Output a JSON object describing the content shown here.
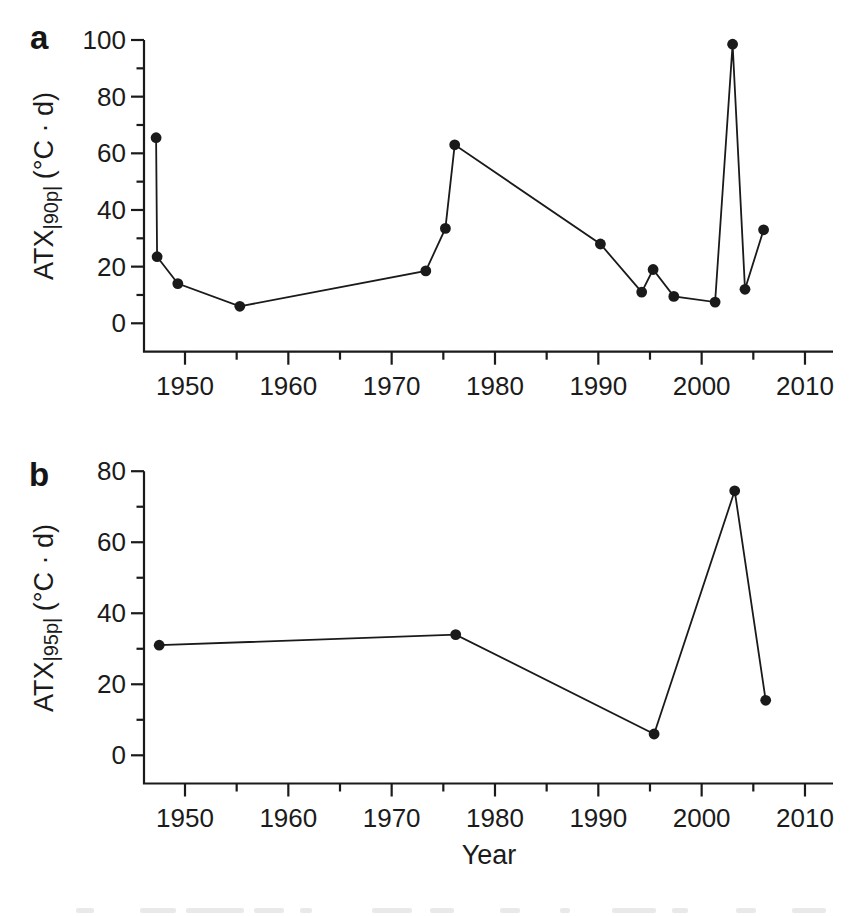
{
  "figure": {
    "panels": [
      {
        "id": "a",
        "label": "a",
        "y_title": {
          "base": "ATX",
          "sub": "|90p|",
          "unit": "(°C · d)"
        }
      },
      {
        "id": "b",
        "label": "b",
        "y_title": {
          "base": "ATX",
          "sub": "|95p|",
          "unit": "(°C · d)"
        }
      }
    ],
    "x_title": "Year"
  },
  "chart_data": [
    {
      "type": "line",
      "panel": "a",
      "title": "",
      "xlabel": "",
      "ylabel": "ATX|90p| (°C·d)",
      "x": [
        1947.2,
        1947.3,
        1949.3,
        1955.3,
        1973.3,
        1975.2,
        1976.1,
        1990.2,
        1994.2,
        1995.3,
        1997.3,
        2001.3,
        2003.0,
        2004.2,
        2006.0
      ],
      "y": [
        65.5,
        23.5,
        14,
        6,
        18.5,
        33.5,
        63,
        28,
        11,
        19,
        9.5,
        7.5,
        98.5,
        12,
        33
      ],
      "xlim": [
        1946,
        2012.7
      ],
      "ylim": [
        0,
        100
      ],
      "x_ticks": [
        1950,
        1960,
        1970,
        1980,
        1990,
        2000,
        2010
      ],
      "x_minor_ticks": [
        1955,
        1965,
        1975,
        1985,
        1995,
        2005
      ],
      "y_ticks": [
        0,
        20,
        40,
        60,
        80,
        100
      ],
      "y_minor_ticks": [
        10,
        30,
        50,
        70,
        90
      ],
      "legend": "none",
      "grid": false,
      "marker": "filled-circle",
      "line_color": "#1a1a1a"
    },
    {
      "type": "line",
      "panel": "b",
      "title": "",
      "xlabel": "Year",
      "ylabel": "ATX|95p| (°C·d)",
      "x": [
        1947.5,
        1976.2,
        1995.4,
        2003.2,
        2006.2
      ],
      "y": [
        31,
        34,
        6,
        74.5,
        15.5
      ],
      "xlim": [
        1946,
        2012.7
      ],
      "ylim": [
        0,
        80
      ],
      "x_ticks": [
        1950,
        1960,
        1970,
        1980,
        1990,
        2000,
        2010
      ],
      "x_minor_ticks": [
        1955,
        1965,
        1975,
        1985,
        1995,
        2005
      ],
      "y_ticks": [
        0,
        20,
        40,
        60,
        80
      ],
      "y_minor_ticks": [
        10,
        30,
        50,
        70
      ],
      "legend": "none",
      "grid": false,
      "marker": "filled-circle",
      "line_color": "#1a1a1a"
    }
  ]
}
